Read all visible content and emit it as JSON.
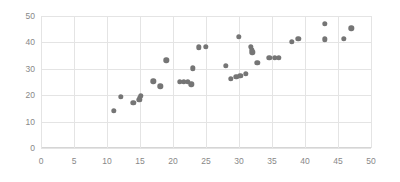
{
  "chart_data": {
    "type": "scatter",
    "title": "",
    "xlabel": "",
    "ylabel": "",
    "xlim": [
      0,
      50
    ],
    "ylim": [
      0,
      50
    ],
    "xticks": [
      0,
      5,
      10,
      15,
      20,
      25,
      30,
      35,
      40,
      45,
      50
    ],
    "yticks": [
      0,
      10,
      20,
      30,
      40,
      50
    ],
    "grid": true,
    "legend": "none",
    "point_color": "#757575",
    "grid_color": "#e4e4e4",
    "axis_color": "#d5d5d5",
    "tick_label_color": "#888888",
    "background_color": "#ffffff",
    "series": [
      {
        "name": "series-1",
        "points": [
          [
            11.0,
            14.2
          ],
          [
            12.1,
            19.4
          ],
          [
            14.0,
            17.1
          ],
          [
            14.9,
            18.2
          ],
          [
            15.0,
            19.0
          ],
          [
            15.1,
            19.7
          ],
          [
            17.0,
            25.3
          ],
          [
            18.1,
            23.3
          ],
          [
            19.0,
            33.2
          ],
          [
            21.0,
            25.1
          ],
          [
            21.6,
            25.0
          ],
          [
            22.2,
            25.1
          ],
          [
            22.8,
            24.2
          ],
          [
            23.0,
            30.2
          ],
          [
            23.9,
            38.2
          ],
          [
            25.0,
            38.3
          ],
          [
            28.0,
            31.2
          ],
          [
            28.8,
            26.2
          ],
          [
            29.6,
            27.0
          ],
          [
            30.0,
            42.2
          ],
          [
            30.2,
            27.3
          ],
          [
            31.0,
            28.2
          ],
          [
            31.8,
            38.3
          ],
          [
            31.9,
            37.1
          ],
          [
            32.0,
            36.3
          ],
          [
            32.8,
            32.2
          ],
          [
            34.6,
            34.2
          ],
          [
            35.4,
            34.2
          ],
          [
            36.0,
            34.2
          ],
          [
            38.0,
            40.2
          ],
          [
            39.0,
            41.3
          ],
          [
            43.0,
            47.1
          ],
          [
            43.0,
            41.2
          ],
          [
            45.9,
            41.3
          ],
          [
            47.0,
            45.3
          ]
        ]
      }
    ]
  }
}
